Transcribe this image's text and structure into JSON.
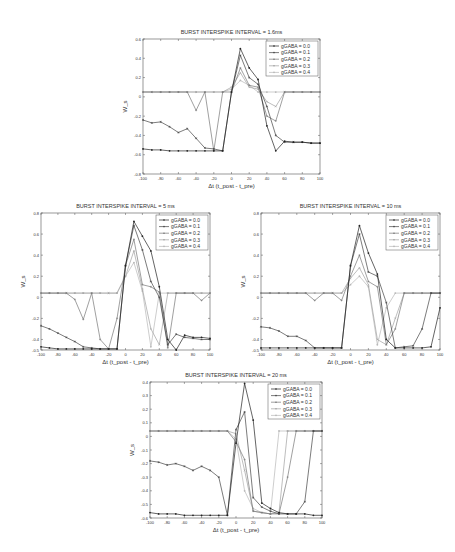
{
  "figure": {
    "xlabel": "Δt (t_post - t_pre)",
    "ylabel": "W_s",
    "legend": [
      "gGABA = 0.0",
      "gGABA = 0.1",
      "gGABA = 0.2",
      "gGABA = 0.3",
      "gGABA = 0.4"
    ]
  },
  "chart_data": [
    {
      "id": "isi-1-6",
      "type": "line",
      "title": "BURST INTERSPIKE INTERVAL = 1.6ms",
      "xlabel": "Δt (t_post - t_pre)",
      "ylabel": "W_s",
      "xlim": [
        -100,
        100
      ],
      "ylim": [
        -0.8,
        0.6
      ],
      "xticks": [
        -100,
        -80,
        -60,
        -40,
        -20,
        0,
        20,
        40,
        60,
        80,
        100
      ],
      "yticks": [
        -0.8,
        -0.6,
        -0.4,
        -0.2,
        0,
        0.2,
        0.4,
        0.6
      ],
      "ytick_labels": [
        "-0.8",
        "-0.6",
        "-0.4",
        "-0.2",
        "0",
        "0.2",
        "0.4",
        "0.6"
      ],
      "legend_position": "upper right",
      "grid": false,
      "box": {
        "left": 143,
        "top": 39,
        "width": 177,
        "height": 135
      },
      "x": [
        -100,
        -90,
        -80,
        -70,
        -60,
        -50,
        -40,
        -30,
        -20,
        -10,
        0,
        10,
        20,
        30,
        40,
        50,
        60,
        70,
        80,
        90,
        100
      ],
      "series": [
        {
          "name": "gGABA = 0.0",
          "values": [
            -0.54,
            -0.55,
            -0.55,
            -0.56,
            -0.56,
            -0.56,
            -0.56,
            -0.56,
            -0.56,
            -0.56,
            0.05,
            0.5,
            0.3,
            0.18,
            -0.3,
            -0.56,
            -0.46,
            -0.47,
            -0.47,
            -0.48,
            -0.48
          ]
        },
        {
          "name": "gGABA = 0.1",
          "values": [
            -0.24,
            -0.27,
            -0.26,
            -0.31,
            -0.37,
            -0.33,
            -0.43,
            -0.53,
            -0.54,
            -0.56,
            0.05,
            0.43,
            0.2,
            0.13,
            -0.1,
            -0.4,
            -0.47,
            -0.47,
            -0.47,
            -0.48,
            -0.48
          ]
        },
        {
          "name": "gGABA = 0.2",
          "values": [
            0.05,
            0.05,
            0.05,
            0.05,
            0.05,
            0.05,
            -0.14,
            0.05,
            -0.56,
            0.05,
            0.05,
            0.3,
            0.12,
            0.1,
            -0.2,
            -0.25,
            0.05,
            0.05,
            0.05,
            0.05,
            0.05
          ]
        },
        {
          "name": "gGABA = 0.3",
          "values": [
            0.05,
            0.05,
            0.05,
            0.05,
            0.05,
            0.05,
            0.05,
            0.05,
            0.05,
            0.05,
            0.1,
            0.25,
            0.1,
            0.08,
            -0.05,
            -0.1,
            0.05,
            0.05,
            0.05,
            0.05,
            0.05
          ]
        },
        {
          "name": "gGABA = 0.4",
          "values": [
            0.05,
            0.05,
            0.05,
            0.05,
            0.05,
            0.05,
            0.05,
            0.05,
            0.05,
            0.05,
            0.08,
            0.17,
            0.12,
            0.05,
            0.05,
            0.05,
            0.05,
            0.05,
            0.05,
            0.05,
            0.05
          ]
        }
      ]
    },
    {
      "id": "isi-5",
      "type": "line",
      "title": "BURST INTERSPIKE INTERVAL = 5 ms",
      "xlabel": "Δt (t_post - t_pre)",
      "ylabel": "W_s",
      "xlim": [
        -100,
        100
      ],
      "ylim": [
        -0.5,
        0.8
      ],
      "xticks": [
        -100,
        -80,
        -60,
        -40,
        -20,
        0,
        20,
        40,
        60,
        80,
        100
      ],
      "yticks": [
        -0.5,
        -0.4,
        -0.2,
        0,
        0.2,
        0.4,
        0.6,
        0.8
      ],
      "ytick_labels": [
        "-0.5",
        "-0.4",
        "-0.2",
        "0",
        "0.2",
        "0.4",
        "0.6",
        "0.8"
      ],
      "legend_position": "upper right",
      "grid": false,
      "box": {
        "left": 41,
        "top": 213,
        "width": 169,
        "height": 137
      },
      "x": [
        -100,
        -90,
        -80,
        -70,
        -60,
        -50,
        -40,
        -30,
        -20,
        -10,
        0,
        10,
        20,
        30,
        40,
        50,
        60,
        70,
        80,
        90,
        100
      ],
      "series": [
        {
          "name": "gGABA = 0.0",
          "values": [
            -0.47,
            -0.48,
            -0.49,
            -0.49,
            -0.49,
            -0.49,
            -0.49,
            -0.49,
            -0.49,
            -0.49,
            0.3,
            0.72,
            0.58,
            0.44,
            0.1,
            -0.4,
            -0.5,
            -0.36,
            -0.38,
            -0.38,
            -0.39
          ]
        },
        {
          "name": "gGABA = 0.1",
          "values": [
            -0.27,
            -0.3,
            -0.34,
            -0.38,
            -0.42,
            -0.47,
            -0.48,
            -0.49,
            -0.49,
            -0.49,
            0.3,
            0.68,
            0.45,
            0.15,
            0.0,
            -0.45,
            -0.35,
            -0.38,
            -0.39,
            -0.4,
            -0.4
          ]
        },
        {
          "name": "gGABA = 0.2",
          "values": [
            0.04,
            0.04,
            0.04,
            0.04,
            -0.02,
            -0.21,
            0.04,
            -0.4,
            -0.49,
            -0.2,
            0.3,
            0.55,
            0.12,
            0.1,
            0.05,
            -0.48,
            0.04,
            0.04,
            0.04,
            -0.03,
            0.04
          ]
        },
        {
          "name": "gGABA = 0.3",
          "values": [
            0.04,
            0.04,
            0.04,
            0.04,
            0.04,
            0.04,
            0.04,
            0.04,
            0.04,
            0.04,
            0.2,
            0.44,
            0.08,
            -0.3,
            -0.45,
            0.04,
            0.04,
            0.04,
            0.04,
            0.04,
            0.04
          ]
        },
        {
          "name": "gGABA = 0.4",
          "values": [
            0.04,
            0.04,
            0.04,
            0.04,
            0.04,
            0.04,
            0.04,
            0.04,
            0.04,
            0.04,
            0.2,
            0.33,
            0.06,
            -0.47,
            0.04,
            0.04,
            0.04,
            0.04,
            0.04,
            0.04,
            0.04
          ]
        }
      ]
    },
    {
      "id": "isi-10",
      "type": "line",
      "title": "BURST INTERSPIKE INTERVAL = 10 ms",
      "xlabel": "Δt (t_post - t_pre)",
      "ylabel": "W_s",
      "xlim": [
        -100,
        100
      ],
      "ylim": [
        -0.5,
        0.8
      ],
      "xticks": [
        -100,
        -80,
        -60,
        -40,
        -20,
        0,
        20,
        40,
        60,
        80,
        100
      ],
      "yticks": [
        -0.5,
        -0.4,
        -0.2,
        0,
        0.2,
        0.4,
        0.6,
        0.8
      ],
      "ytick_labels": [
        "-0.5",
        "-0.4",
        "-0.2",
        "0",
        "0.2",
        "0.4",
        "0.6",
        "0.8"
      ],
      "legend_position": "upper right",
      "grid": false,
      "box": {
        "left": 261,
        "top": 213,
        "width": 179,
        "height": 137
      },
      "x": [
        -100,
        -90,
        -80,
        -70,
        -60,
        -50,
        -40,
        -30,
        -20,
        -10,
        0,
        10,
        20,
        30,
        40,
        50,
        60,
        70,
        80,
        90,
        100
      ],
      "series": [
        {
          "name": "gGABA = 0.0",
          "values": [
            -0.48,
            -0.48,
            -0.48,
            -0.48,
            -0.48,
            -0.48,
            -0.48,
            -0.48,
            -0.48,
            -0.48,
            0.3,
            0.68,
            0.42,
            0.22,
            -0.4,
            -0.48,
            -0.48,
            -0.48,
            -0.48,
            -0.47,
            -0.1
          ]
        },
        {
          "name": "gGABA = 0.1",
          "values": [
            -0.28,
            -0.29,
            -0.32,
            -0.37,
            -0.37,
            -0.41,
            -0.48,
            -0.48,
            -0.48,
            -0.48,
            0.3,
            0.6,
            0.24,
            0.2,
            -0.05,
            -0.48,
            -0.47,
            -0.46,
            -0.3,
            0.04,
            0.04
          ]
        },
        {
          "name": "gGABA = 0.2",
          "values": [
            0.04,
            0.04,
            0.04,
            0.04,
            0.04,
            0.04,
            -0.03,
            0.04,
            0.04,
            -0.03,
            0.2,
            0.4,
            0.15,
            0.1,
            -0.45,
            -0.3,
            0.04,
            0.04,
            0.04,
            0.04,
            0.04
          ]
        },
        {
          "name": "gGABA = 0.3",
          "values": [
            0.04,
            0.04,
            0.04,
            0.04,
            0.04,
            0.04,
            0.04,
            0.04,
            0.04,
            0.04,
            0.18,
            0.28,
            0.12,
            -0.4,
            -0.45,
            -0.2,
            0.04,
            0.04,
            0.04,
            0.04,
            0.04
          ]
        },
        {
          "name": "gGABA = 0.4",
          "values": [
            0.04,
            0.04,
            0.04,
            0.04,
            0.04,
            0.04,
            0.04,
            0.04,
            0.04,
            0.04,
            0.12,
            0.2,
            0.1,
            -0.45,
            -0.1,
            0.04,
            0.04,
            0.04,
            0.04,
            0.04,
            0.04
          ]
        }
      ]
    },
    {
      "id": "isi-20",
      "type": "line",
      "title": "BURST INTERSPIKE INTERVAL = 20 ms",
      "xlabel": "Δt (t_post - t_pre)",
      "ylabel": "W_s",
      "xlim": [
        -100,
        100
      ],
      "ylim": [
        -0.6,
        0.4
      ],
      "xticks": [
        -100,
        -80,
        -60,
        -40,
        -20,
        0,
        20,
        40,
        60,
        80,
        100
      ],
      "yticks": [
        -0.6,
        -0.5,
        -0.4,
        -0.3,
        -0.2,
        -0.1,
        0,
        0.1,
        0.2,
        0.3,
        0.4
      ],
      "ytick_labels": [
        "-0.6",
        "-0.5",
        "-0.4",
        "-0.3",
        "-0.2",
        "-0.1",
        "0",
        "0.1",
        "0.2",
        "0.3",
        "0.4"
      ],
      "legend_position": "upper right",
      "grid": false,
      "box": {
        "left": 150,
        "top": 382,
        "width": 172,
        "height": 136
      },
      "x": [
        -100,
        -90,
        -80,
        -70,
        -60,
        -50,
        -40,
        -30,
        -20,
        -10,
        0,
        10,
        20,
        30,
        40,
        50,
        60,
        70,
        80,
        90,
        100
      ],
      "series": [
        {
          "name": "gGABA = 0.0",
          "values": [
            -0.56,
            -0.57,
            -0.57,
            -0.57,
            -0.58,
            -0.58,
            -0.58,
            -0.58,
            -0.58,
            -0.58,
            -0.05,
            0.39,
            0.12,
            -0.49,
            -0.53,
            -0.56,
            -0.57,
            -0.57,
            -0.57,
            -0.58,
            -0.58
          ]
        },
        {
          "name": "gGABA = 0.1",
          "values": [
            -0.18,
            -0.19,
            -0.21,
            -0.2,
            -0.22,
            -0.25,
            -0.22,
            -0.25,
            -0.3,
            -0.58,
            0.05,
            0.18,
            -0.45,
            -0.52,
            -0.55,
            -0.57,
            -0.57,
            -0.57,
            -0.48,
            0.04,
            0.04
          ]
        },
        {
          "name": "gGABA = 0.2",
          "values": [
            0.04,
            0.04,
            0.04,
            0.04,
            0.04,
            0.04,
            0.04,
            0.04,
            0.04,
            0.04,
            -0.04,
            -0.17,
            -0.55,
            -0.56,
            -0.57,
            -0.57,
            -0.3,
            0.04,
            0.04,
            0.04,
            0.04
          ]
        },
        {
          "name": "gGABA = 0.3",
          "values": [
            0.04,
            0.04,
            0.04,
            0.04,
            0.04,
            0.04,
            0.04,
            0.04,
            0.04,
            0.04,
            0.02,
            -0.25,
            -0.55,
            -0.56,
            -0.57,
            -0.56,
            0.04,
            0.04,
            0.04,
            0.04,
            0.04
          ]
        },
        {
          "name": "gGABA = 0.4",
          "values": [
            0.04,
            0.04,
            0.04,
            0.04,
            0.04,
            0.04,
            0.04,
            0.04,
            0.04,
            0.04,
            -0.02,
            -0.4,
            -0.53,
            -0.56,
            -0.57,
            0.04,
            0.04,
            0.04,
            0.04,
            0.04,
            0.04
          ]
        }
      ]
    }
  ],
  "styles": {
    "series_colors": [
      "#222222",
      "#444444",
      "#777777",
      "#a0a0a0",
      "#b8b8b8"
    ],
    "axis_color": "#555555"
  }
}
